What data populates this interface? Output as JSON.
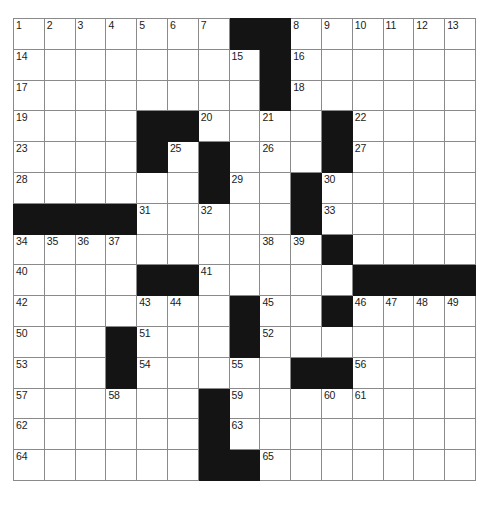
{
  "document": {
    "type": "crossword-puzzle-grid",
    "title": "Crossword Puzzle Grid",
    "rows": 15,
    "columns": 15,
    "cell_size_px": 30.8,
    "colors": {
      "block": "#141414",
      "cell": "#ffffff",
      "gridline": "#8a8a8a",
      "number": "#1a1a1a",
      "page_background": "#ffffff"
    },
    "max_clue_number": 65
  },
  "grid": {
    "legend": {
      "block": "#",
      "open": "."
    },
    "pattern": [
      ".......##......",
      ".......#.......",
      ".......#.......",
      "....##..#.#....",
      "....#.#.#.#....",
      "......#...#....",
      "####.....#.....",
      "....................",
      "....##.....#####",
      "....#.#.#.#....",
      "...#...#.......",
      "...#...#..##...",
      "...............",
      "......#........",
      "......##......."
    ],
    "block_cells": [
      [
        0,
        7
      ],
      [
        0,
        8
      ],
      [
        1,
        8
      ],
      [
        2,
        8
      ],
      [
        3,
        4
      ],
      [
        3,
        5
      ],
      [
        3,
        10
      ],
      [
        4,
        4
      ],
      [
        4,
        6
      ],
      [
        4,
        10
      ],
      [
        5,
        6
      ],
      [
        5,
        9
      ],
      [
        6,
        0
      ],
      [
        6,
        1
      ],
      [
        6,
        2
      ],
      [
        6,
        3
      ],
      [
        6,
        9
      ],
      [
        7,
        10
      ],
      [
        8,
        4
      ],
      [
        8,
        5
      ],
      [
        8,
        11
      ],
      [
        8,
        12
      ],
      [
        8,
        13
      ],
      [
        8,
        14
      ],
      [
        9,
        7
      ],
      [
        9,
        10
      ],
      [
        10,
        3
      ],
      [
        10,
        7
      ],
      [
        11,
        3
      ],
      [
        11,
        9
      ],
      [
        11,
        10
      ],
      [
        12,
        6
      ],
      [
        13,
        6
      ],
      [
        14,
        6
      ],
      [
        14,
        7
      ]
    ],
    "numbered_cells": [
      {
        "row": 0,
        "col": 0,
        "number": "1"
      },
      {
        "row": 0,
        "col": 1,
        "number": "2"
      },
      {
        "row": 0,
        "col": 2,
        "number": "3"
      },
      {
        "row": 0,
        "col": 3,
        "number": "4"
      },
      {
        "row": 0,
        "col": 4,
        "number": "5"
      },
      {
        "row": 0,
        "col": 5,
        "number": "6"
      },
      {
        "row": 0,
        "col": 6,
        "number": "7"
      },
      {
        "row": 0,
        "col": 9,
        "number": "8"
      },
      {
        "row": 0,
        "col": 10,
        "number": "9"
      },
      {
        "row": 0,
        "col": 11,
        "number": "10"
      },
      {
        "row": 0,
        "col": 12,
        "number": "11"
      },
      {
        "row": 0,
        "col": 13,
        "number": "12"
      },
      {
        "row": 0,
        "col": 14,
        "number": "13"
      },
      {
        "row": 1,
        "col": 0,
        "number": "14"
      },
      {
        "row": 1,
        "col": 7,
        "number": "15"
      },
      {
        "row": 1,
        "col": 9,
        "number": "16"
      },
      {
        "row": 2,
        "col": 0,
        "number": "17"
      },
      {
        "row": 2,
        "col": 9,
        "number": "18"
      },
      {
        "row": 3,
        "col": 0,
        "number": "19"
      },
      {
        "row": 3,
        "col": 6,
        "number": "20"
      },
      {
        "row": 3,
        "col": 8,
        "number": "21"
      },
      {
        "row": 3,
        "col": 11,
        "number": "22"
      },
      {
        "row": 4,
        "col": 0,
        "number": "23"
      },
      {
        "row": 4,
        "col": 4,
        "number": "24"
      },
      {
        "row": 4,
        "col": 5,
        "number": "25"
      },
      {
        "row": 4,
        "col": 8,
        "number": "26"
      },
      {
        "row": 4,
        "col": 11,
        "number": "27"
      },
      {
        "row": 5,
        "col": 0,
        "number": "28"
      },
      {
        "row": 5,
        "col": 7,
        "number": "29"
      },
      {
        "row": 5,
        "col": 10,
        "number": "30"
      },
      {
        "row": 6,
        "col": 4,
        "number": "31"
      },
      {
        "row": 6,
        "col": 6,
        "number": "32"
      },
      {
        "row": 6,
        "col": 10,
        "number": "33"
      },
      {
        "row": 7,
        "col": 0,
        "number": "34"
      },
      {
        "row": 7,
        "col": 1,
        "number": "35"
      },
      {
        "row": 7,
        "col": 2,
        "number": "36"
      },
      {
        "row": 7,
        "col": 3,
        "number": "37"
      },
      {
        "row": 7,
        "col": 8,
        "number": "38"
      },
      {
        "row": 7,
        "col": 9,
        "number": "39"
      },
      {
        "row": 8,
        "col": 0,
        "number": "40"
      },
      {
        "row": 8,
        "col": 6,
        "number": "41"
      },
      {
        "row": 9,
        "col": 0,
        "number": "42"
      },
      {
        "row": 9,
        "col": 4,
        "number": "43"
      },
      {
        "row": 9,
        "col": 5,
        "number": "44"
      },
      {
        "row": 9,
        "col": 8,
        "number": "45"
      },
      {
        "row": 9,
        "col": 11,
        "number": "46"
      },
      {
        "row": 9,
        "col": 12,
        "number": "47"
      },
      {
        "row": 9,
        "col": 13,
        "number": "48"
      },
      {
        "row": 9,
        "col": 14,
        "number": "49"
      },
      {
        "row": 10,
        "col": 0,
        "number": "50"
      },
      {
        "row": 10,
        "col": 4,
        "number": "51"
      },
      {
        "row": 10,
        "col": 8,
        "number": "52"
      },
      {
        "row": 11,
        "col": 0,
        "number": "53"
      },
      {
        "row": 11,
        "col": 4,
        "number": "54"
      },
      {
        "row": 11,
        "col": 7,
        "number": "55"
      },
      {
        "row": 11,
        "col": 11,
        "number": "56"
      },
      {
        "row": 12,
        "col": 0,
        "number": "57"
      },
      {
        "row": 12,
        "col": 3,
        "number": "58"
      },
      {
        "row": 12,
        "col": 7,
        "number": "59"
      },
      {
        "row": 12,
        "col": 10,
        "number": "60"
      },
      {
        "row": 12,
        "col": 11,
        "number": "61"
      },
      {
        "row": 13,
        "col": 0,
        "number": "62"
      },
      {
        "row": 13,
        "col": 7,
        "number": "63"
      },
      {
        "row": 14,
        "col": 0,
        "number": "64"
      },
      {
        "row": 14,
        "col": 8,
        "number": "65"
      }
    ]
  }
}
